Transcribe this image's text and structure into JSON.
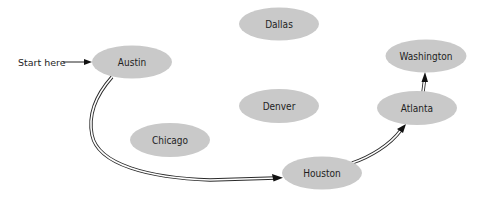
{
  "diagram": {
    "title": "",
    "start_label": "Start here",
    "colors": {
      "node_fill": "#c9c9c9",
      "text": "#1e1e1e",
      "edge": "#2a2a2a",
      "background": "#ffffff"
    },
    "nodes": [
      {
        "id": "austin",
        "label": "Austin",
        "cx": 132,
        "cy": 62
      },
      {
        "id": "dallas",
        "label": "Dallas",
        "cx": 279,
        "cy": 24
      },
      {
        "id": "washington",
        "label": "Washington",
        "cx": 426,
        "cy": 56
      },
      {
        "id": "denver",
        "label": "Denver",
        "cx": 279,
        "cy": 106
      },
      {
        "id": "atlanta",
        "label": "Atlanta",
        "cx": 417,
        "cy": 108
      },
      {
        "id": "chicago",
        "label": "Chicago",
        "cx": 170,
        "cy": 140
      },
      {
        "id": "houston",
        "label": "Houston",
        "cx": 322,
        "cy": 173
      }
    ],
    "edges": [
      {
        "from": "start",
        "to": "Austin",
        "style": "single-arrow"
      },
      {
        "from": "Austin",
        "to": "Houston",
        "style": "double-line-arrow"
      },
      {
        "from": "Houston",
        "to": "Atlanta",
        "style": "double-line-arrow"
      },
      {
        "from": "Atlanta",
        "to": "Washington",
        "style": "double-line-arrow"
      }
    ]
  }
}
